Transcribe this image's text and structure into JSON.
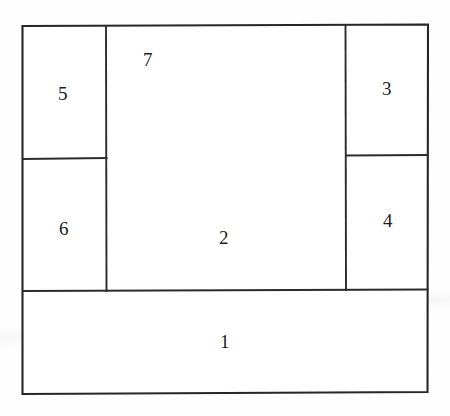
{
  "figure": {
    "background_color": "#fefefe",
    "line_color": "#262626",
    "label_color": "#1d1d1d",
    "outer_boundary": {
      "left": 22,
      "top": 25,
      "right": 428,
      "bottom": 393
    },
    "regions": [
      {
        "id": "region-1",
        "label": "1",
        "label_x": 225,
        "label_y": 342,
        "x": 22,
        "y": 290,
        "width": 406,
        "height": 103
      },
      {
        "id": "region-2",
        "label": "2",
        "label_x": 224,
        "label_y": 238,
        "x": 106,
        "y": 25,
        "width": 240,
        "height": 265
      },
      {
        "id": "region-3",
        "label": "3",
        "label_x": 387,
        "label_y": 89,
        "x": 346,
        "y": 25,
        "width": 82,
        "height": 130
      },
      {
        "id": "region-4",
        "label": "4",
        "label_x": 388,
        "label_y": 221,
        "x": 346,
        "y": 155,
        "width": 82,
        "height": 135
      },
      {
        "id": "region-5",
        "label": "5",
        "label_x": 63,
        "label_y": 94,
        "x": 22,
        "y": 25,
        "width": 84,
        "height": 134
      },
      {
        "id": "region-6",
        "label": "6",
        "label_x": 64,
        "label_y": 229,
        "x": 22,
        "y": 159,
        "width": 84,
        "height": 131
      },
      {
        "id": "region-7",
        "label": "7",
        "label_x": 148,
        "label_y": 60,
        "x": 106,
        "y": 25,
        "width": 240,
        "height": 265
      }
    ],
    "dividers": [
      {
        "id": "divider-left-vertical",
        "orientation": "vertical",
        "x1": 106,
        "y1": 25,
        "x2": 106,
        "y2": 290
      },
      {
        "id": "divider-right-vertical",
        "orientation": "vertical",
        "x1": 346,
        "y1": 25,
        "x2": 346,
        "y2": 290
      },
      {
        "id": "divider-left-horizontal",
        "orientation": "horizontal",
        "x1": 22,
        "y1": 159,
        "x2": 106,
        "y2": 158
      },
      {
        "id": "divider-right-horizontal",
        "orientation": "horizontal",
        "x1": 346,
        "y1": 155,
        "x2": 428,
        "y2": 155
      },
      {
        "id": "divider-bottom-horizontal",
        "orientation": "horizontal",
        "x1": 22,
        "y1": 291,
        "x2": 428,
        "y2": 289
      }
    ]
  }
}
